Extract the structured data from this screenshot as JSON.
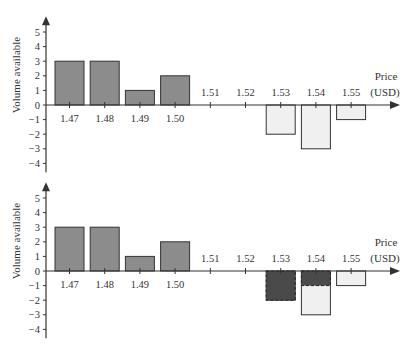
{
  "colors": {
    "positive_bar": "#8c8c8c",
    "negative_bar": "#f0f0f0",
    "highlight_bar": "#4a4a4a",
    "axis": "#333333"
  },
  "chart_data": [
    {
      "type": "bar",
      "title": "",
      "xlabel": "Price (USD)",
      "ylabel": "Volume available",
      "categories": [
        "1.47",
        "1.48",
        "1.49",
        "1.50",
        "1.51",
        "1.52",
        "1.53",
        "1.54",
        "1.55"
      ],
      "series": [
        {
          "name": "Bids (buy volume)",
          "values": [
            3,
            3,
            1,
            2,
            0,
            0,
            0,
            0,
            0
          ]
        },
        {
          "name": "Asks (sell volume)",
          "values": [
            0,
            0,
            0,
            0,
            0,
            0,
            -2,
            -3,
            -1
          ]
        }
      ],
      "ylim": [
        -4,
        5
      ],
      "yticks": [
        -4,
        -3,
        -2,
        -1,
        0,
        1,
        2,
        3,
        4,
        5
      ],
      "grid": false
    },
    {
      "type": "bar",
      "title": "",
      "xlabel": "Price (USD)",
      "ylabel": "Volume available",
      "categories": [
        "1.47",
        "1.48",
        "1.49",
        "1.50",
        "1.51",
        "1.52",
        "1.53",
        "1.54",
        "1.55"
      ],
      "series": [
        {
          "name": "Bids (buy volume)",
          "values": [
            3,
            3,
            1,
            2,
            0,
            0,
            0,
            0,
            0
          ]
        },
        {
          "name": "Asks (sell volume)",
          "values": [
            0,
            0,
            0,
            0,
            0,
            0,
            -2,
            -3,
            -1
          ]
        },
        {
          "name": "Executed/consumed volume (dashed)",
          "values": [
            0,
            0,
            0,
            0,
            0,
            0,
            -2,
            -1,
            0
          ]
        }
      ],
      "ylim": [
        -4,
        5
      ],
      "yticks": [
        -4,
        -3,
        -2,
        -1,
        0,
        1,
        2,
        3,
        4,
        5
      ],
      "grid": false
    }
  ],
  "labels": {
    "ylabel": "Volume available",
    "xlabel_line1": "Price",
    "xlabel_line2": "(USD)",
    "yticks": [
      "5",
      "4",
      "3",
      "2",
      "1",
      "0",
      "−1",
      "−2",
      "−3",
      "−4"
    ],
    "xticks": [
      "1.47",
      "1.48",
      "1.49",
      "1.50",
      "1.51",
      "1.52",
      "1.53",
      "1.54",
      "1.55"
    ]
  }
}
